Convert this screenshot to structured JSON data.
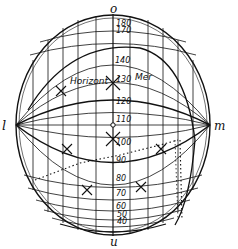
{
  "diagram": {
    "pole_labels": {
      "top": "o",
      "bottom": "u",
      "left": "l",
      "right": "m"
    },
    "curve_labels": {
      "horizon": "Horizont",
      "meridian": "Mer"
    },
    "scale_values": [
      "180",
      "170",
      "140",
      "130",
      "120",
      "110",
      "100",
      "90",
      "80",
      "70",
      "60",
      "50",
      "40"
    ],
    "colors": {
      "ink": "#111111",
      "background": "#ffffff"
    }
  }
}
